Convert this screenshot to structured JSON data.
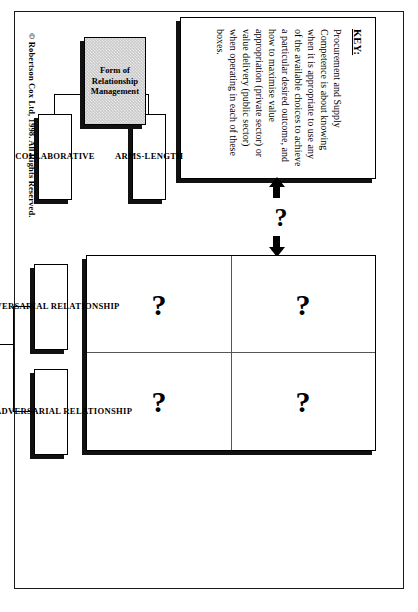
{
  "figure": {
    "key_box": {
      "label": "KEY:",
      "text": "Procurement and Supply Competence is about knowing when it is appropriate to use any of the available choices to achieve a particular desired outcome, and how to maximise value appropriation (private sector) or value delivery (public sector) when operating in each of these boxes."
    },
    "matrix": {
      "cells": [
        {
          "id": "top-left",
          "value": "?"
        },
        {
          "id": "top-right",
          "value": "?"
        },
        {
          "id": "bottom-left",
          "value": "?"
        },
        {
          "id": "bottom-right",
          "value": "?"
        }
      ]
    },
    "link": {
      "question": "?"
    },
    "relationship_labels": [
      {
        "id": "adversarial",
        "text": "ADVERSARIAL RELATIONSHIP"
      },
      {
        "id": "non-adversarial",
        "text": "NON- ADVERSARIAL RELATIONSHIP"
      }
    ],
    "form_labels": [
      {
        "id": "arms-length",
        "text": "ARMS-LENGTH"
      },
      {
        "id": "collaborative",
        "text": "COLLABORATIVE"
      }
    ],
    "goal_box": {
      "text": "The Goal of the Organisation"
    },
    "form_box": {
      "text": "Form of Relationship Management"
    },
    "copyright": "© Robertson Cox Ltd, 1998.    All Rights Reserved.",
    "colors": {
      "line": "#000000",
      "shaded_box": "#c9c9c9",
      "page_background": "#ffffff"
    }
  }
}
